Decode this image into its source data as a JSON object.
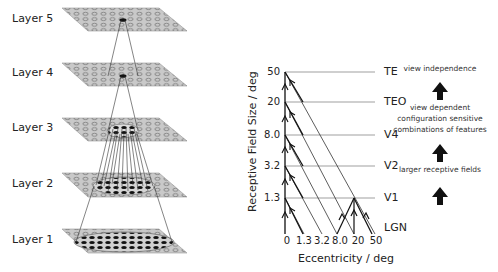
{
  "left_panel": {
    "layers": [
      {
        "label": "Layer 5",
        "y": 20
      },
      {
        "label": "Layer 4",
        "y": 73
      },
      {
        "label": "Layer 3",
        "y": 128
      },
      {
        "label": "Layer 2",
        "y": 184
      },
      {
        "label": "Layer 1",
        "y": 240
      }
    ]
  },
  "right_panel": {
    "y_axis_title": "Receptive Field Size / deg",
    "x_axis_title": "Eccentricity / deg",
    "y_ticks": [
      "50",
      "20",
      "8.0",
      "3.2",
      "1.3"
    ],
    "x_ticks": [
      "0",
      "1.3",
      "3.2",
      "8.0",
      "20",
      "50"
    ],
    "areas": [
      "TE",
      "TEO",
      "V4",
      "V2",
      "V1",
      "LGN"
    ],
    "annotations": {
      "top": "view independence",
      "middle_line1": "view dependent",
      "middle_line2": "configuration sensitive",
      "middle_line3": "combinations of features",
      "bottom": "larger receptive fields"
    }
  },
  "colors": {
    "plane_fill": "#c8c8c8",
    "plane_stroke": "#888888",
    "unit_active": "#111111",
    "line": "#333333",
    "grid_line": "#777777"
  }
}
